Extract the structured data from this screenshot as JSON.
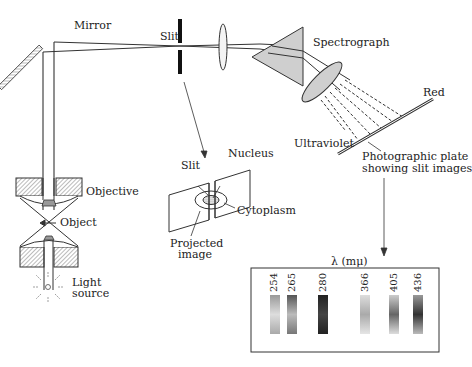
{
  "labels": {
    "mirror": "Mirror",
    "slit": "Slit",
    "spectrograph": "Spectrograph",
    "red": "Red",
    "ultraviolet": "Ultraviolet",
    "plate_line1": "Photographic plate",
    "plate_line2": "showing slit images",
    "objective": "Objective",
    "object": "Object",
    "light_line1": "Light",
    "light_line2": "source",
    "inset_slit": "Slit",
    "nucleus": "Nucleus",
    "cytoplasm": "Cytoplasm",
    "projected_line1": "Projected",
    "projected_line2": "image",
    "lambda_axis": "λ (mμ)"
  },
  "spectrum": {
    "wavelengths": [
      "254",
      "265",
      "280",
      "366",
      "405",
      "436"
    ],
    "band_darkness": [
      0.45,
      0.7,
      0.95,
      0.35,
      0.6,
      0.75
    ]
  },
  "colors": {
    "line": "#222222",
    "fill_gray": "#cccccc",
    "hatch": "#888888"
  }
}
